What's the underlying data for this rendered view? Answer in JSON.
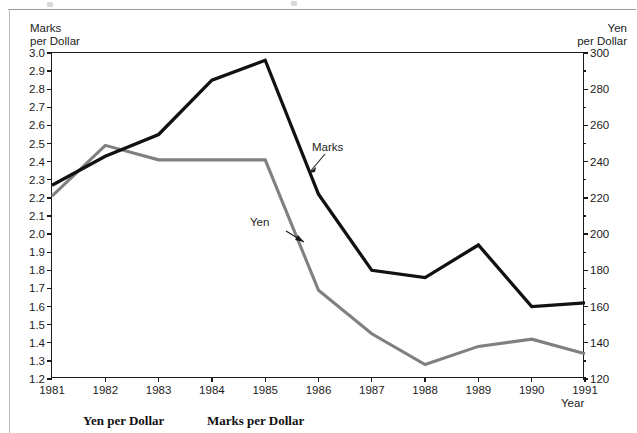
{
  "chart_data": {
    "type": "line",
    "title": "",
    "xlabel": "Year",
    "categories": [
      "1981",
      "1982",
      "1983",
      "1984",
      "1985",
      "1986",
      "1987",
      "1988",
      "1989",
      "1990",
      "1991"
    ],
    "x": [
      1981,
      1982,
      1983,
      1984,
      1985,
      1986,
      1987,
      1988,
      1989,
      1990,
      1991
    ],
    "grid": false,
    "legend_position": "inline-annotations",
    "axes": {
      "left": {
        "label_line1": "Marks",
        "label_line2": "per Dollar",
        "min": 1.2,
        "max": 3.0,
        "step": 0.1,
        "ticks": [
          "3.0",
          "2.9",
          "2.8",
          "2.7",
          "2.6",
          "2.5",
          "2.4",
          "2.3",
          "2.2",
          "2.1",
          "2.0",
          "1.9",
          "1.8",
          "1.7",
          "1.6",
          "1.5",
          "1.4",
          "1.3",
          "1.2"
        ],
        "tick_values": [
          3.0,
          2.9,
          2.8,
          2.7,
          2.6,
          2.5,
          2.4,
          2.3,
          2.2,
          2.1,
          2.0,
          1.9,
          1.8,
          1.7,
          1.6,
          1.5,
          1.4,
          1.3,
          1.2
        ]
      },
      "right": {
        "label_line1": "Yen",
        "label_line2": "per Dollar",
        "min": 120,
        "max": 300,
        "step": 20,
        "minor_step": 10,
        "ticks": [
          "300",
          "280",
          "260",
          "240",
          "220",
          "200",
          "180",
          "160",
          "140",
          "120"
        ],
        "tick_values": [
          300,
          280,
          260,
          240,
          220,
          200,
          180,
          160,
          140,
          120
        ]
      },
      "x": {
        "label": "Year",
        "min": 1981,
        "max": 1991
      }
    },
    "series": [
      {
        "name": "Marks",
        "axis": "left",
        "color": "#111111",
        "values": [
          2.27,
          2.43,
          2.55,
          2.85,
          2.96,
          2.22,
          1.8,
          1.76,
          1.94,
          1.6,
          1.62
        ]
      },
      {
        "name": "Yen",
        "axis": "right",
        "color": "#808080",
        "values": [
          221,
          249,
          241,
          241,
          241,
          169,
          145,
          128,
          138,
          142,
          134
        ]
      }
    ],
    "annotations": [
      {
        "text": "Marks",
        "series": "Marks"
      },
      {
        "text": "Yen",
        "series": "Yen"
      }
    ]
  },
  "captions": {
    "yen": "Yen per Dollar",
    "marks": "Marks per Dollar"
  }
}
